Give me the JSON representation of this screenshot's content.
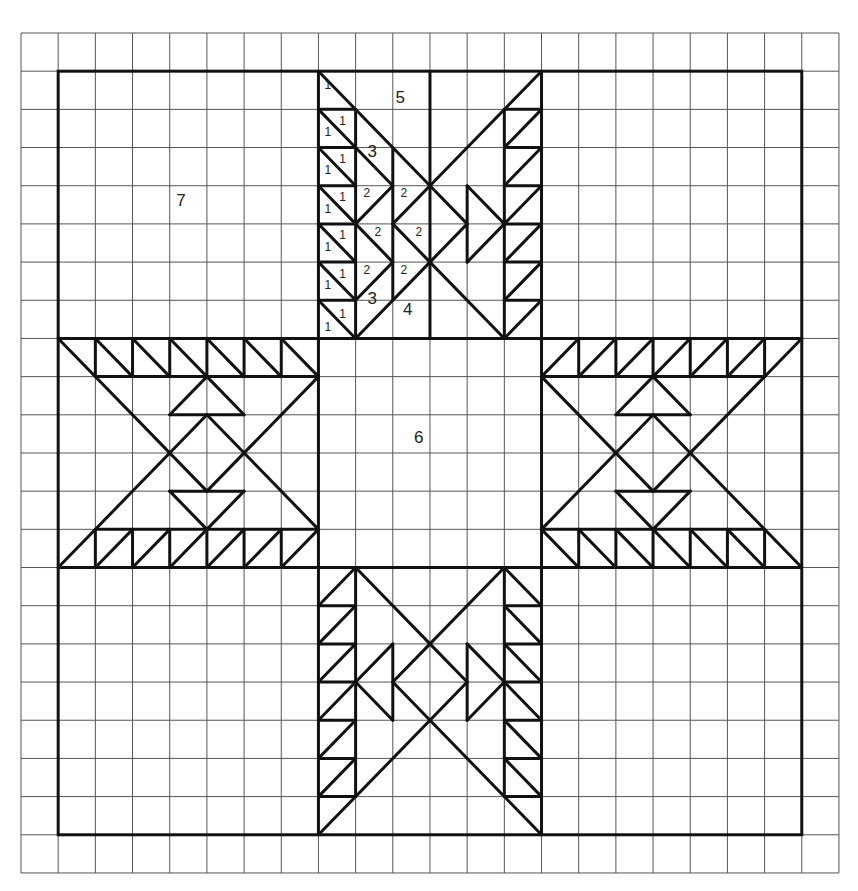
{
  "diagram": {
    "type": "quilt-block-pattern",
    "grid": {
      "origin_px": [
        21,
        33
      ],
      "cell_px": [
        37.18,
        38.18
      ],
      "cols": 22,
      "rows": 22,
      "color": "#555555"
    },
    "line_color": "#111111",
    "outer_border": {
      "from": [
        1,
        1
      ],
      "to": [
        21,
        21
      ]
    },
    "blocks": [
      {
        "name": "corner-top-left",
        "from": [
          1,
          1
        ],
        "to": [
          8,
          8
        ]
      },
      {
        "name": "top-arm",
        "from": [
          8,
          1
        ],
        "to": [
          14,
          8
        ]
      },
      {
        "name": "corner-top-right",
        "from": [
          14,
          1
        ],
        "to": [
          21,
          8
        ]
      },
      {
        "name": "left-arm",
        "from": [
          1,
          8
        ],
        "to": [
          8,
          14
        ]
      },
      {
        "name": "center-square",
        "from": [
          8,
          8
        ],
        "to": [
          14,
          14
        ]
      },
      {
        "name": "right-arm",
        "from": [
          14,
          8
        ],
        "to": [
          21,
          14
        ]
      },
      {
        "name": "corner-bottom-left",
        "from": [
          1,
          14
        ],
        "to": [
          8,
          21
        ]
      },
      {
        "name": "bottom-arm",
        "from": [
          8,
          14
        ],
        "to": [
          14,
          21
        ]
      },
      {
        "name": "corner-bottom-right",
        "from": [
          14,
          14
        ],
        "to": [
          21,
          21
        ]
      }
    ],
    "labels": [
      {
        "text": "7",
        "at": [
          4.3,
          4.4
        ],
        "size": "big",
        "region": "corner-background"
      },
      {
        "text": "6",
        "at": [
          10.7,
          10.6
        ],
        "size": "big",
        "region": "center-square"
      },
      {
        "text": "5",
        "at": [
          10.2,
          1.7
        ],
        "size": "big",
        "region": "top-arm-background"
      },
      {
        "text": "3",
        "at": [
          9.45,
          3.1
        ],
        "size": "big"
      },
      {
        "text": "3",
        "at": [
          9.45,
          6.95
        ],
        "size": "big"
      },
      {
        "text": "4",
        "at": [
          10.4,
          7.25
        ],
        "size": "big"
      },
      {
        "text": "2",
        "at": [
          9.3,
          4.2
        ],
        "size": "small"
      },
      {
        "text": "2",
        "at": [
          10.3,
          4.2
        ],
        "size": "small"
      },
      {
        "text": "2",
        "at": [
          9.6,
          5.2
        ],
        "size": "small"
      },
      {
        "text": "2",
        "at": [
          10.7,
          5.2
        ],
        "size": "small"
      },
      {
        "text": "2",
        "at": [
          9.3,
          6.2
        ],
        "size": "small"
      },
      {
        "text": "2",
        "at": [
          10.3,
          6.2
        ],
        "size": "small"
      },
      {
        "text": "1",
        "at": [
          8.25,
          1.35
        ],
        "size": "small"
      },
      {
        "text": "1",
        "at": [
          8.25,
          2.6
        ],
        "size": "small"
      },
      {
        "text": "1",
        "at": [
          8.65,
          2.3
        ],
        "size": "small"
      },
      {
        "text": "1",
        "at": [
          8.25,
          3.6
        ],
        "size": "small"
      },
      {
        "text": "1",
        "at": [
          8.65,
          3.3
        ],
        "size": "small"
      },
      {
        "text": "1",
        "at": [
          8.25,
          4.6
        ],
        "size": "small"
      },
      {
        "text": "1",
        "at": [
          8.65,
          4.3
        ],
        "size": "small"
      },
      {
        "text": "1",
        "at": [
          8.25,
          5.6
        ],
        "size": "small"
      },
      {
        "text": "1",
        "at": [
          8.65,
          5.3
        ],
        "size": "small"
      },
      {
        "text": "1",
        "at": [
          8.25,
          6.6
        ],
        "size": "small"
      },
      {
        "text": "1",
        "at": [
          8.65,
          6.3
        ],
        "size": "small"
      },
      {
        "text": "1",
        "at": [
          8.25,
          7.7
        ],
        "size": "small"
      },
      {
        "text": "1",
        "at": [
          8.65,
          7.35
        ],
        "size": "small"
      }
    ],
    "segments": [
      [
        1,
        8,
        21,
        8
      ],
      [
        1,
        14,
        21,
        14
      ],
      [
        8,
        1,
        8,
        21
      ],
      [
        14,
        1,
        14,
        21
      ],
      [
        11,
        1,
        11,
        8
      ],
      [
        9,
        2,
        9,
        8
      ],
      [
        10,
        3,
        10,
        7
      ],
      [
        8,
        2,
        9,
        2
      ],
      [
        8,
        3,
        9,
        3
      ],
      [
        8,
        4,
        9,
        4
      ],
      [
        8,
        5,
        9,
        5
      ],
      [
        8,
        6,
        9,
        6
      ],
      [
        8,
        7,
        9,
        7
      ],
      [
        8,
        1,
        11,
        4
      ],
      [
        8,
        2,
        9,
        3
      ],
      [
        8,
        3,
        9,
        4
      ],
      [
        8,
        4,
        9,
        5
      ],
      [
        8,
        5,
        9,
        6
      ],
      [
        8,
        6,
        9,
        7
      ],
      [
        8,
        7,
        9,
        8
      ],
      [
        9,
        3,
        10,
        4
      ],
      [
        10,
        4,
        9,
        5
      ],
      [
        9,
        5,
        10,
        6
      ],
      [
        10,
        6,
        9,
        7
      ],
      [
        11,
        4,
        10,
        5
      ],
      [
        10,
        5,
        11,
        6
      ],
      [
        9,
        8,
        11,
        6
      ],
      [
        13,
        2,
        13,
        8
      ],
      [
        13,
        2,
        14,
        2
      ],
      [
        13,
        3,
        14,
        3
      ],
      [
        13,
        4,
        14,
        4
      ],
      [
        13,
        5,
        14,
        5
      ],
      [
        13,
        6,
        14,
        6
      ],
      [
        13,
        7,
        14,
        7
      ],
      [
        14,
        1,
        11,
        4
      ],
      [
        13,
        3,
        14,
        2
      ],
      [
        13,
        4,
        14,
        3
      ],
      [
        13,
        5,
        14,
        4
      ],
      [
        13,
        6,
        14,
        5
      ],
      [
        13,
        7,
        14,
        6
      ],
      [
        13,
        8,
        14,
        7
      ],
      [
        11,
        4,
        12,
        5
      ],
      [
        12,
        5,
        11,
        6
      ],
      [
        12,
        4,
        12,
        6
      ],
      [
        12,
        4,
        13,
        5
      ],
      [
        13,
        5,
        12,
        6
      ],
      [
        11,
        6,
        13,
        8
      ],
      [
        2,
        9,
        8,
        9
      ],
      [
        2,
        13,
        8,
        13
      ],
      [
        2,
        8,
        2,
        9
      ],
      [
        3,
        8,
        3,
        9
      ],
      [
        4,
        8,
        4,
        9
      ],
      [
        5,
        8,
        5,
        9
      ],
      [
        6,
        8,
        6,
        9
      ],
      [
        7,
        8,
        7,
        9
      ],
      [
        2,
        8,
        3,
        9
      ],
      [
        3,
        8,
        4,
        9
      ],
      [
        4,
        8,
        5,
        9
      ],
      [
        5,
        8,
        6,
        9
      ],
      [
        6,
        8,
        7,
        9
      ],
      [
        7,
        8,
        8,
        9
      ],
      [
        2,
        13,
        2,
        14
      ],
      [
        3,
        13,
        3,
        14
      ],
      [
        4,
        13,
        4,
        14
      ],
      [
        5,
        13,
        5,
        14
      ],
      [
        6,
        13,
        6,
        14
      ],
      [
        7,
        13,
        7,
        14
      ],
      [
        2,
        14,
        3,
        13
      ],
      [
        3,
        14,
        4,
        13
      ],
      [
        4,
        14,
        5,
        13
      ],
      [
        5,
        14,
        6,
        13
      ],
      [
        6,
        14,
        7,
        13
      ],
      [
        7,
        14,
        8,
        13
      ],
      [
        1,
        8,
        5,
        12
      ],
      [
        5,
        12,
        8,
        9
      ],
      [
        1,
        14,
        5,
        10
      ],
      [
        5,
        10,
        8,
        13
      ],
      [
        4,
        10,
        6,
        10
      ],
      [
        4,
        10,
        5,
        9
      ],
      [
        5,
        9,
        6,
        10
      ],
      [
        4,
        12,
        6,
        12
      ],
      [
        4,
        12,
        5,
        13
      ],
      [
        5,
        13,
        6,
        12
      ],
      [
        14,
        9,
        20,
        9
      ],
      [
        14,
        13,
        20,
        13
      ],
      [
        15,
        8,
        15,
        9
      ],
      [
        16,
        8,
        16,
        9
      ],
      [
        17,
        8,
        17,
        9
      ],
      [
        18,
        8,
        18,
        9
      ],
      [
        19,
        8,
        19,
        9
      ],
      [
        20,
        8,
        20,
        9
      ],
      [
        14,
        9,
        15,
        8
      ],
      [
        15,
        9,
        16,
        8
      ],
      [
        16,
        9,
        17,
        8
      ],
      [
        17,
        9,
        18,
        8
      ],
      [
        18,
        9,
        19,
        8
      ],
      [
        19,
        9,
        20,
        8
      ],
      [
        15,
        13,
        15,
        14
      ],
      [
        16,
        13,
        16,
        14
      ],
      [
        17,
        13,
        17,
        14
      ],
      [
        18,
        13,
        18,
        14
      ],
      [
        19,
        13,
        19,
        14
      ],
      [
        20,
        13,
        20,
        14
      ],
      [
        14,
        13,
        15,
        14
      ],
      [
        15,
        13,
        16,
        14
      ],
      [
        16,
        13,
        17,
        14
      ],
      [
        17,
        13,
        18,
        14
      ],
      [
        18,
        13,
        19,
        14
      ],
      [
        19,
        13,
        20,
        14
      ],
      [
        21,
        8,
        17,
        12
      ],
      [
        17,
        12,
        14,
        9
      ],
      [
        21,
        14,
        17,
        10
      ],
      [
        17,
        10,
        14,
        13
      ],
      [
        16,
        10,
        18,
        10
      ],
      [
        16,
        10,
        17,
        9
      ],
      [
        17,
        9,
        18,
        10
      ],
      [
        16,
        12,
        18,
        12
      ],
      [
        16,
        12,
        17,
        13
      ],
      [
        17,
        13,
        18,
        12
      ],
      [
        9,
        14,
        9,
        20
      ],
      [
        13,
        14,
        13,
        20
      ],
      [
        8,
        15,
        9,
        15
      ],
      [
        8,
        16,
        9,
        16
      ],
      [
        8,
        17,
        9,
        17
      ],
      [
        8,
        18,
        9,
        18
      ],
      [
        8,
        19,
        9,
        19
      ],
      [
        8,
        20,
        9,
        20
      ],
      [
        8,
        15,
        9,
        14
      ],
      [
        8,
        16,
        9,
        15
      ],
      [
        8,
        17,
        9,
        16
      ],
      [
        8,
        18,
        9,
        17
      ],
      [
        8,
        19,
        9,
        18
      ],
      [
        8,
        20,
        9,
        19
      ],
      [
        13,
        15,
        14,
        15
      ],
      [
        13,
        16,
        14,
        16
      ],
      [
        13,
        17,
        14,
        17
      ],
      [
        13,
        18,
        14,
        18
      ],
      [
        13,
        19,
        14,
        19
      ],
      [
        13,
        20,
        14,
        20
      ],
      [
        13,
        14,
        14,
        15
      ],
      [
        13,
        15,
        14,
        16
      ],
      [
        13,
        16,
        14,
        17
      ],
      [
        13,
        17,
        14,
        18
      ],
      [
        13,
        18,
        14,
        19
      ],
      [
        13,
        19,
        14,
        20
      ],
      [
        9,
        14,
        11,
        16
      ],
      [
        13,
        14,
        11,
        16
      ],
      [
        11,
        16,
        12,
        17
      ],
      [
        12,
        17,
        11,
        18
      ],
      [
        11,
        16,
        10,
        17
      ],
      [
        10,
        17,
        11,
        18
      ],
      [
        11,
        18,
        8,
        21
      ],
      [
        11,
        18,
        14,
        21
      ],
      [
        10,
        16,
        10,
        18
      ],
      [
        10,
        16,
        9,
        17
      ],
      [
        9,
        17,
        10,
        18
      ],
      [
        12,
        16,
        12,
        18
      ],
      [
        12,
        16,
        13,
        17
      ],
      [
        13,
        17,
        12,
        18
      ]
    ]
  }
}
